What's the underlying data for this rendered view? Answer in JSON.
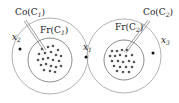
{
  "diagram": {
    "clusters": [
      {
        "id": "C1",
        "core_label": "Co(C",
        "core_sub": "1",
        "frontier_label": "Fr(C",
        "frontier_sub": "1",
        "outlier_label": "x",
        "outlier_sub": "2"
      },
      {
        "id": "C2",
        "core_label": "Co(C",
        "core_sub": "2",
        "frontier_label": "Fr(C",
        "frontier_sub": "2",
        "outlier_label": "x",
        "outlier_sub": "3"
      }
    ],
    "middle_point": {
      "label": "x",
      "sub": "1"
    },
    "colors": {
      "stroke": "#9a9a9a",
      "dots": "#555555",
      "points": "#111111"
    }
  }
}
